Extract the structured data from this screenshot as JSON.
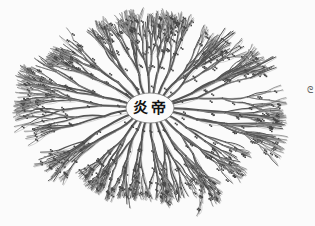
{
  "diagram": {
    "type": "radial genealogical tree",
    "center_label": "炎帝",
    "side_mark": "ᘓ",
    "colors": {
      "ink": "#555555",
      "paper": "#fbfbfb",
      "center": "#111111"
    },
    "center": {
      "x": 150,
      "y": 108
    },
    "branch_count_estimate": 60
  }
}
